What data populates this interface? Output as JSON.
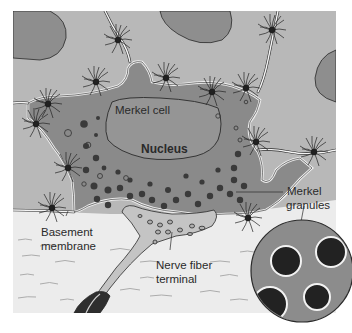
{
  "figure": {
    "colors": {
      "background": "#ffffff",
      "epidermis": "#b8b8b8",
      "neighbor_cells": "#8e8e8e",
      "merkel_cell": "#8a8a8a",
      "nucleus": "#959595",
      "dermis": "#ececec",
      "nerve_terminal": "#c4c4c4",
      "granule": "#2e2e2e",
      "outline": "#2a2a2a",
      "membrane_white": "#f4f4f4",
      "inset_circle": "#8c8c8c"
    }
  },
  "labels": {
    "merkel_cell": "Merkel cell",
    "nucleus": "Nucleus",
    "merkel_granules_line1": "Merkel",
    "merkel_granules_line2": "granules",
    "basement_membrane_line1": "Basement",
    "basement_membrane_line2": "membrane",
    "nerve_fiber_line1": "Nerve fiber",
    "nerve_fiber_line2": "terminal"
  }
}
